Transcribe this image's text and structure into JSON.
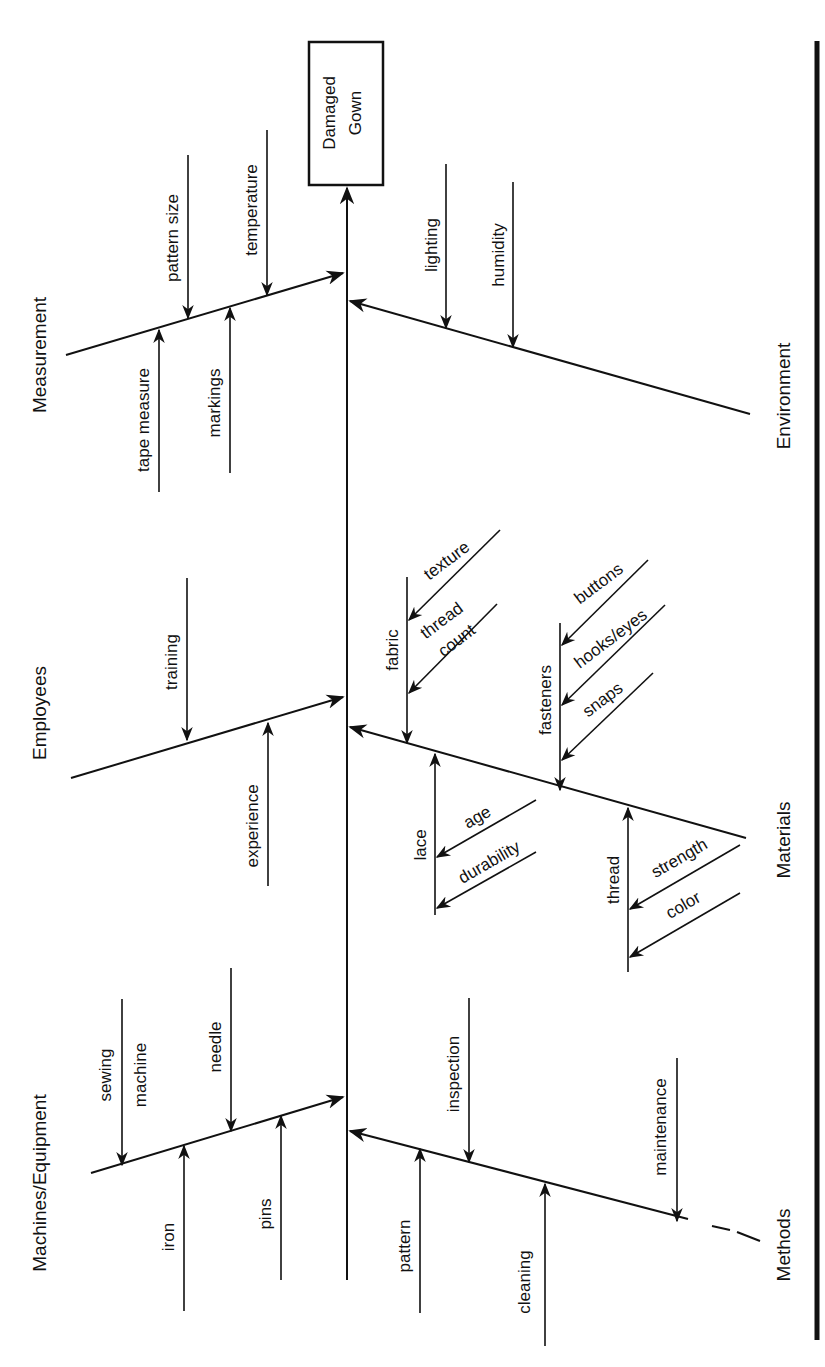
{
  "diagram": {
    "type": "fishbone",
    "orientation": "rotated-90-ccw",
    "effect": {
      "line1": "Damaged",
      "line2": "Gown"
    },
    "categories": {
      "measurement": {
        "label": "Measurement",
        "causes": [
          "pattern size",
          "temperature",
          "tape measure",
          "markings"
        ]
      },
      "environment": {
        "label": "Environment",
        "causes": [
          "lighting",
          "humidity"
        ]
      },
      "employees": {
        "label": "Employees",
        "causes": [
          "training",
          "experience"
        ]
      },
      "materials": {
        "label": "Materials",
        "sub": {
          "fabric": {
            "label": "fabric",
            "causes": [
              "texture",
              "thread",
              "count"
            ]
          },
          "fasteners": {
            "label": "fasteners",
            "causes": [
              "buttons",
              "hooks/eyes",
              "snaps"
            ]
          },
          "lace": {
            "label": "lace",
            "causes": [
              "age",
              "durability"
            ]
          },
          "thread": {
            "label": "thread",
            "causes": [
              "strength",
              "color"
            ]
          }
        }
      },
      "machines": {
        "label": "Machines/Equipment",
        "causes": [
          "sewing",
          "machine",
          "needle",
          "iron",
          "pins"
        ]
      },
      "methods": {
        "label": "Methods",
        "causes": [
          "inspection",
          "maintenance",
          "pattern",
          "cleaning"
        ]
      }
    }
  }
}
